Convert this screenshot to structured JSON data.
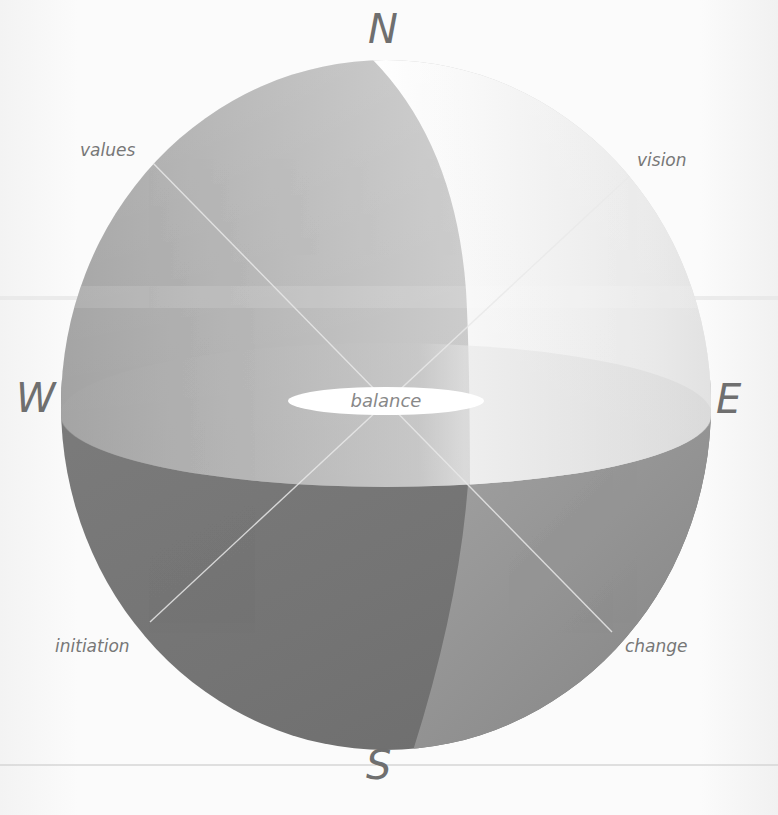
{
  "diagram": {
    "compass_points": {
      "north": "N",
      "south": "S",
      "west": "W",
      "east": "E"
    },
    "quadrant_labels": {
      "north_west": "values",
      "north_east": "vision",
      "south_west": "initiation",
      "south_east": "change"
    },
    "center_label": "balance",
    "colors": {
      "background": "#fbfbfb",
      "sphere_dark": "#6e6e6e",
      "sphere_mid": "#a9a9a9",
      "sphere_light": "#f4f4f4",
      "highlight": "#ffffff",
      "text": "#777777"
    }
  }
}
